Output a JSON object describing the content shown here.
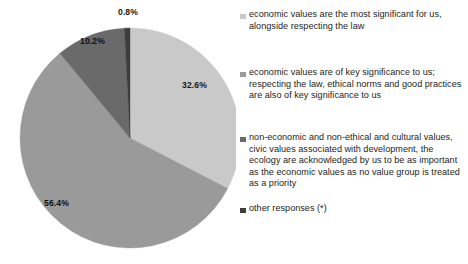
{
  "chart_data": {
    "type": "pie",
    "title": "",
    "subtitle": "",
    "xlabel": "",
    "ylabel": "",
    "grid": false,
    "legend_position": "right",
    "start_angle_deg": 0,
    "direction": "clockwise",
    "units": "percent",
    "categories": [
      "economic values are the most significant for us, alongside respecting the law",
      "economic values are of key significance to us; respecting the law, ethical norms and good practices are also of key significance to us",
      "non-economic and non-ethical and cultural values, civic values associated with development, the ecology are acknowledged by us to be as important as the economic values as no value group is treated as a priority",
      "other responses (*)"
    ],
    "values": [
      32.6,
      56.4,
      10.2,
      0.8
    ],
    "value_labels": [
      "32.6%",
      "56.4%",
      "10.2%",
      "0.8%"
    ],
    "colors": [
      "#c9c9c9",
      "#9a9a9a",
      "#6a6a6a",
      "#3d3d3d"
    ],
    "slices": [
      {
        "label": "economic values are the most significant for us, alongside respecting the law",
        "value": 32.6,
        "display": "32.6%",
        "color": "#c9c9c9"
      },
      {
        "label": "economic values are of key significance to us; respecting the law, ethical norms and good practices are also of key significance to us",
        "value": 56.4,
        "display": "56.4%",
        "color": "#9a9a9a"
      },
      {
        "label": "non-economic and non-ethical and cultural values, civic values associated with development, the ecology are acknowledged by us to be as important as the economic values as no value group is treated as a priority",
        "value": 10.2,
        "display": "10.2%",
        "color": "#6a6a6a"
      },
      {
        "label": "other responses (*)",
        "value": 0.8,
        "display": "0.8%",
        "color": "#3d3d3d"
      }
    ]
  },
  "legend": {
    "items": [
      {
        "label": "economic values are the most significant for us, alongside respecting the law",
        "color": "#c9c9c9"
      },
      {
        "label": "economic values are of key significance to us; respecting the law, ethical norms and good practices are also of key significance to us",
        "color": "#9a9a9a"
      },
      {
        "label": "non-economic and non-ethical and cultural values, civic values associated with development, the ecology are acknowledged by us to be as important as the economic values as no value group is treated as a priority",
        "color": "#6a6a6a"
      },
      {
        "label": "other responses (*)",
        "color": "#3d3d3d"
      }
    ]
  }
}
